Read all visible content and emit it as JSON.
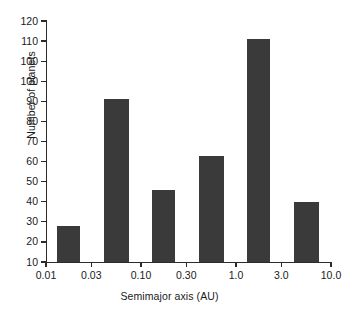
{
  "chart_data": {
    "type": "bar",
    "title": "",
    "xlabel": "Semimajor axis (AU)",
    "ylabel": "Number of planets",
    "xscale": "log",
    "xlim": [
      0.01,
      10.0
    ],
    "ylim": [
      0,
      120
    ],
    "ytick_labels": [
      "120",
      "110",
      "100",
      "100",
      "90",
      "80",
      "70",
      "60",
      "50",
      "40",
      "30",
      "20",
      "10",
      "0"
    ],
    "ytick_values": [
      120,
      110,
      100,
      90,
      80,
      70,
      60,
      50,
      40,
      30,
      20,
      10,
      0
    ],
    "xtick_labels": [
      "0.01",
      "0.03",
      "0.10",
      "0.30",
      "1.0",
      "3.0",
      "10.0"
    ],
    "xtick_values": [
      0.01,
      0.03,
      0.1,
      0.3,
      1.0,
      3.0,
      10.0
    ],
    "categories": [
      "0.01-0.03",
      "0.03-0.10",
      "0.10-0.30",
      "0.30-1.0",
      "1.0-3.0",
      "3.0-10.0"
    ],
    "values": [
      18,
      81,
      36,
      53,
      111,
      30
    ],
    "bar_color": "#3a3a3a",
    "axis_color": "#2b2b2b",
    "background": "#ffffff",
    "grid": false,
    "legend": false
  }
}
